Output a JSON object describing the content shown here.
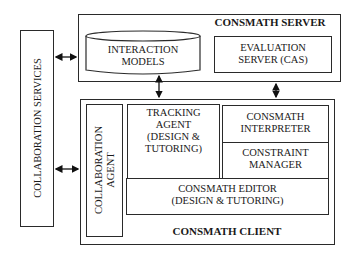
{
  "server": {
    "title": "CONSMATH SERVER",
    "interaction_models": "INTERACTION\nMODELS",
    "evaluation_server": "EVALUATION\nSERVER (CAS)"
  },
  "collaboration_services": {
    "label": "COLLABORATION SERVICES"
  },
  "client": {
    "title": "CONSMATH CLIENT",
    "collaboration_agent": "COLLABORATION\nAGENT",
    "tracking_agent": "TRACKING\nAGENT\n(DESIGN &\nTUTORING)",
    "interpreter": "CONSMATH\nINTERPRETER",
    "constraint_manager": "CONSTRAINT\nMANAGER",
    "editor": "CONSMATH EDITOR\n(DESIGN & TUTORING)"
  },
  "connections": [
    {
      "from": "collaboration_services",
      "to": "server",
      "type": "bidirectional"
    },
    {
      "from": "collaboration_services",
      "to": "client",
      "type": "bidirectional"
    },
    {
      "from": "interaction_models",
      "to": "client",
      "type": "bidirectional"
    },
    {
      "from": "evaluation_server",
      "to": "interpreter",
      "type": "bidirectional"
    }
  ]
}
